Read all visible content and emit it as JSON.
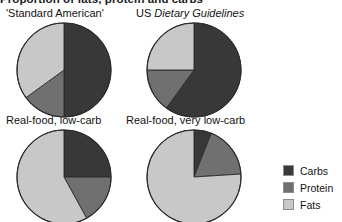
{
  "headline": "Proportion of fats, protein and carbs",
  "legend": {
    "position": "right",
    "items": [
      {
        "label": "Carbs",
        "color": "#383838"
      },
      {
        "label": "Protein",
        "color": "#707070"
      },
      {
        "label": "Fats",
        "color": "#c8c8c8"
      }
    ]
  },
  "panels": [
    {
      "label_plain": "'Standard American'",
      "label_italic": ""
    },
    {
      "label_plain": "US ",
      "label_italic": "Dietary Guidelines"
    },
    {
      "label_plain": "Real-food, low-carb",
      "label_italic": ""
    },
    {
      "label_plain": "Real-food, very low-carb",
      "label_italic": ""
    }
  ],
  "chart_data": [
    {
      "type": "pie",
      "title": "'Standard American'",
      "categories": [
        "Carbs",
        "Protein",
        "Fats"
      ],
      "values": [
        50,
        15,
        35
      ],
      "colors": [
        "#383838",
        "#707070",
        "#c8c8c8"
      ],
      "start_angle_deg": 0,
      "direction": "clockwise",
      "units": "percent"
    },
    {
      "type": "pie",
      "title": "US Dietary Guidelines",
      "categories": [
        "Carbs",
        "Protein",
        "Fats"
      ],
      "values": [
        60,
        15,
        25
      ],
      "colors": [
        "#383838",
        "#707070",
        "#c8c8c8"
      ],
      "start_angle_deg": 0,
      "direction": "clockwise",
      "units": "percent"
    },
    {
      "type": "pie",
      "title": "Real-food, low-carb",
      "categories": [
        "Carbs",
        "Protein",
        "Fats"
      ],
      "values": [
        25,
        17,
        58
      ],
      "colors": [
        "#383838",
        "#707070",
        "#c8c8c8"
      ],
      "start_angle_deg": 0,
      "direction": "clockwise",
      "units": "percent"
    },
    {
      "type": "pie",
      "title": "Real-food, very low-carb",
      "categories": [
        "Carbs",
        "Protein",
        "Fats"
      ],
      "values": [
        6,
        18,
        76
      ],
      "colors": [
        "#383838",
        "#707070",
        "#c8c8c8"
      ],
      "start_angle_deg": 0,
      "direction": "clockwise",
      "units": "percent"
    }
  ]
}
